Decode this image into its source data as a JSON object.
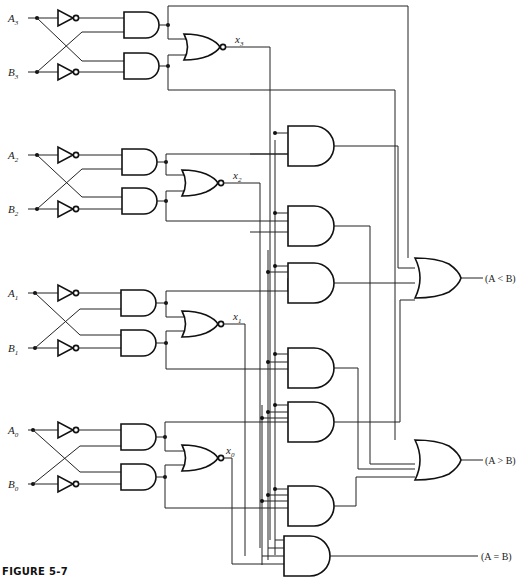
{
  "figure": {
    "caption": "FIGURE 5-7"
  },
  "inputs": [
    {
      "name": "A",
      "sub": "3"
    },
    {
      "name": "B",
      "sub": "3"
    },
    {
      "name": "A",
      "sub": "2"
    },
    {
      "name": "B",
      "sub": "2"
    },
    {
      "name": "A",
      "sub": "1"
    },
    {
      "name": "B",
      "sub": "1"
    },
    {
      "name": "A",
      "sub": "0"
    },
    {
      "name": "B",
      "sub": "0"
    }
  ],
  "equality_signals": [
    {
      "name": "x",
      "sub": "3"
    },
    {
      "name": "x",
      "sub": "2"
    },
    {
      "name": "x",
      "sub": "1"
    },
    {
      "name": "x",
      "sub": "0"
    }
  ],
  "outputs": {
    "less": "(A < B)",
    "greater": "(A > B)",
    "equal": "(A = B)"
  }
}
